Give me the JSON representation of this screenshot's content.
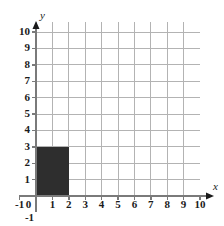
{
  "chart_data": {
    "type": "area",
    "title": "",
    "xlabel": "x",
    "ylabel": "y",
    "xlim": [
      -1,
      10
    ],
    "ylim": [
      -1,
      10
    ],
    "grid": true,
    "legend": "none",
    "x_ticks": [
      "-1",
      "0",
      "1",
      "2",
      "3",
      "4",
      "5",
      "6",
      "7",
      "8",
      "9",
      "10"
    ],
    "x_tick_values": [
      -1,
      0,
      1,
      2,
      3,
      4,
      5,
      6,
      7,
      8,
      9,
      10
    ],
    "y_ticks": [
      "-1",
      "0",
      "1",
      "2",
      "3",
      "4",
      "5",
      "6",
      "7",
      "8",
      "9",
      "10"
    ],
    "y_tick_values": [
      -1,
      0,
      1,
      2,
      3,
      4,
      5,
      6,
      7,
      8,
      9,
      10
    ],
    "shaded_regions": [
      {
        "name": "shaded-rectangle",
        "x_start": 0,
        "x_end": 2,
        "y_start": 0,
        "y_end": 3,
        "width_units": 2,
        "height_units": 3,
        "area_units": 6,
        "fill_color": "#2e2e2e"
      }
    ],
    "colors": {
      "grid": "#b3b3b3",
      "axis": "#7a7a7a",
      "shade": "#2e2e2e",
      "text": "#1a1a1a",
      "background": "#ffffff"
    }
  },
  "axis_labels": {
    "x": "x",
    "y": "y"
  }
}
